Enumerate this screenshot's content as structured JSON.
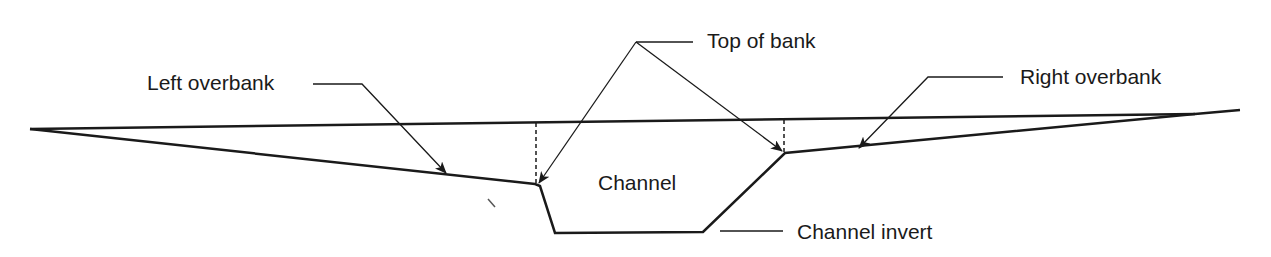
{
  "diagram": {
    "type": "channel-cross-section",
    "labels": {
      "left_overbank": "Left overbank",
      "top_of_bank": "Top of bank",
      "right_overbank": "Right overbank",
      "channel": "Channel",
      "channel_invert": "Channel invert"
    },
    "colors": {
      "line": "#1a1a1a",
      "background": "#ffffff"
    }
  }
}
